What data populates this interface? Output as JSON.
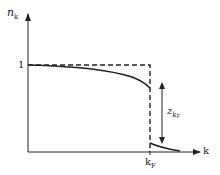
{
  "diagram": {
    "type": "momentum-distribution",
    "y_axis": {
      "label_main": "n",
      "label_sub": "k"
    },
    "x_axis": {
      "label": "k"
    },
    "y_tick": {
      "label": "1"
    },
    "x_tick": {
      "label_main": "k",
      "label_sub": "F"
    },
    "gap_annotation": {
      "label_main": "z",
      "label_sub": "k",
      "label_subsub": "F"
    },
    "colors": {
      "line": "#222222",
      "background": "#ffffff"
    },
    "curves": [
      {
        "name": "free-fermion-step",
        "style": "dashed"
      },
      {
        "name": "interacting-distribution",
        "style": "solid"
      }
    ]
  }
}
